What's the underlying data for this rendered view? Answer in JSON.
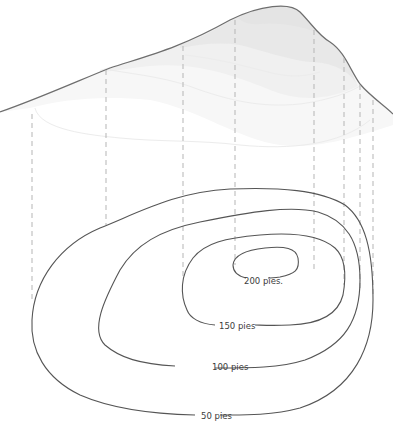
{
  "diagram": {
    "type": "topographic-contour-illustration",
    "profile": {
      "description": "3D terrain profile of a hill projected onto a contour map"
    },
    "contours": [
      {
        "elevation": 50,
        "label": "50 pies"
      },
      {
        "elevation": 100,
        "label": "100 pies"
      },
      {
        "elevation": 150,
        "label": "150 pies"
      },
      {
        "elevation": 200,
        "label": "200 pies."
      }
    ],
    "projection_lines_x": [
      32,
      106,
      183,
      235,
      314,
      344,
      360,
      373
    ],
    "colors": {
      "contour_stroke": "#555555",
      "profile_stroke": "#6e6e6e",
      "profile_fill": "#e4e4e4",
      "dashed_lines": "#b5b5b5",
      "background": "#ffffff"
    }
  }
}
